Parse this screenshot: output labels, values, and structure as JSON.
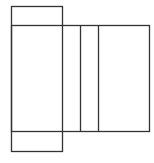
{
  "diagram": {
    "width": 154,
    "height": 163,
    "stroke": "#333333",
    "background": "#ffffff",
    "shapes": [
      {
        "name": "tall-rectangle",
        "x": 11,
        "y": 6,
        "w": 51,
        "h": 145
      },
      {
        "name": "wide-rectangle",
        "x": 11,
        "y": 25,
        "w": 138,
        "h": 106
      }
    ],
    "lines": [
      {
        "name": "divider-line-1",
        "x1": 80,
        "y1": 25,
        "x2": 80,
        "y2": 131
      },
      {
        "name": "divider-line-2",
        "x1": 98,
        "y1": 25,
        "x2": 98,
        "y2": 131
      }
    ]
  }
}
